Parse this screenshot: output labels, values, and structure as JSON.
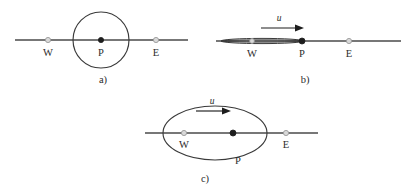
{
  "figure": {
    "background_color": "#ffffff",
    "line_color": "#4a4a4a",
    "wave_color": "#3a3a3a",
    "marker_open_color": "#d9d9d9",
    "marker_filled_color": "#1d1d1d",
    "arrow_color": "#1d1d1d"
  },
  "panels": [
    {
      "id": "a",
      "caption": "a)",
      "shape": "circle",
      "has_velocity_arrow": false,
      "velocity_symbol": "",
      "points": [
        {
          "name": "W",
          "label": "W",
          "marker": "open",
          "label_position": "below"
        },
        {
          "name": "P",
          "label": "P",
          "marker": "filled",
          "label_position": "below"
        },
        {
          "name": "E",
          "label": "E",
          "marker": "open",
          "label_position": "below"
        }
      ]
    },
    {
      "id": "b",
      "caption": "b)",
      "shape": "degenerate-sliver",
      "has_velocity_arrow": true,
      "velocity_symbol": "u",
      "points": [
        {
          "name": "W",
          "label": "W",
          "marker": "open",
          "label_position": "below"
        },
        {
          "name": "P",
          "label": "P",
          "marker": "filled",
          "label_position": "below"
        },
        {
          "name": "E",
          "label": "E",
          "marker": "open",
          "label_position": "below"
        }
      ]
    },
    {
      "id": "c",
      "caption": "c)",
      "shape": "ellipse",
      "has_velocity_arrow": true,
      "velocity_symbol": "u",
      "points": [
        {
          "name": "W",
          "label": "W",
          "marker": "open",
          "label_position": "below"
        },
        {
          "name": "P",
          "label": "P",
          "marker": "filled",
          "label_position": "below"
        },
        {
          "name": "E",
          "label": "E",
          "marker": "open",
          "label_position": "below"
        }
      ]
    }
  ]
}
